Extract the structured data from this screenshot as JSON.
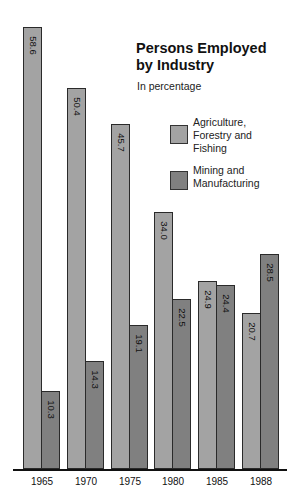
{
  "chart_data": {
    "type": "bar",
    "title": "Persons Employed by Industry",
    "subtitle": "In percentage",
    "xlabel": "",
    "ylabel": "",
    "categories": [
      "1965",
      "1970",
      "1975",
      "1980",
      "1985",
      "1988"
    ],
    "series": [
      {
        "name": "Agriculture, Forestry and Fishing",
        "color": "#a3a3a3",
        "values": [
          58.6,
          50.4,
          45.7,
          34.0,
          24.9,
          20.7
        ],
        "labels": [
          "58.6",
          "50.4",
          "45.7",
          "34.0",
          "24.9",
          "20.7"
        ]
      },
      {
        "name": "Mining and Manufacturing",
        "color": "#808080",
        "values": [
          10.3,
          14.3,
          19.1,
          22.5,
          24.4,
          28.5
        ],
        "labels": [
          "10.3",
          "14.3",
          "19.1",
          "22.5",
          "24.4",
          "28.5"
        ]
      }
    ],
    "ylim": [
      0,
      60
    ],
    "grid": false,
    "legend_position": "upper right",
    "value_labels": "rotated inside top of bars"
  },
  "title_line1": "Persons Employed",
  "title_line2": "by Industry",
  "subtitle": "In percentage",
  "legend": [
    {
      "label": "Agriculture,\nForestry and\nFishing",
      "color": "#a3a3a3"
    },
    {
      "label": "Mining and\nManufacturing",
      "color": "#808080"
    }
  ]
}
